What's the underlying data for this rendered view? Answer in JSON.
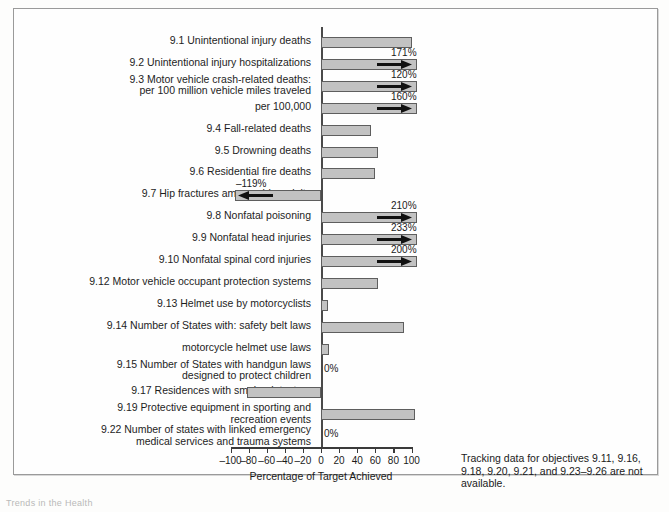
{
  "figure": {
    "x_axis_title": "Percentage of Target Achieved",
    "note": "Tracking data for objectives 9.11, 9.16, 9.18, 9.20, 9.21, and 9.23–9.26 are not available.",
    "bottom_caption": "Trends in the Health",
    "bar_fill_color": "#c2c2c2",
    "bar_border_color": "#5e5e5e"
  },
  "chart_data": {
    "type": "bar",
    "orientation": "horizontal",
    "title": "",
    "xlabel": "Percentage of Target Achieved",
    "ylabel": "",
    "xlim": [
      -100,
      100
    ],
    "xticks": [
      -100,
      -80,
      -60,
      -40,
      -20,
      0,
      20,
      40,
      60,
      80,
      100
    ],
    "xticklabels": [
      "–100",
      "–80",
      "–60",
      "–40",
      "–20",
      "0",
      "20",
      "40",
      "60",
      "80",
      "100"
    ],
    "grid": false,
    "legend": false,
    "categories": [
      "9.1 Unintentional injury deaths",
      "9.2 Unintentional injury hospitalizations",
      "9.3 Motor vehicle crash-related deaths:\nper 100 million vehicle miles traveled",
      "per 100,000",
      "9.4 Fall-related deaths",
      "9.5 Drowning deaths",
      "9.6 Residential fire deaths",
      "9.7 Hip fractures among older adults",
      "9.8 Nonfatal poisoning",
      "9.9 Nonfatal head injuries",
      "9.10 Nonfatal spinal cord injuries",
      "9.12 Motor vehicle occupant protection systems",
      "9.13 Helmet use by motorcyclists",
      "9.14 Number of States with: safety belt laws",
      "motorcycle helmet use laws",
      "9.15 Number of States with handgun laws\ndesigned to protect children",
      "9.17 Residences with smoke detectors",
      "9.19 Protective equipment in sporting and\nrecreation events",
      "9.22 Number of states with linked emergency\nmedical services and trauma systems"
    ],
    "values": [
      100,
      171,
      120,
      160,
      55,
      63,
      60,
      -119,
      210,
      233,
      200,
      63,
      8,
      92,
      9,
      0,
      -82,
      104,
      0
    ],
    "value_labels": [
      "",
      "171%",
      "120%",
      "160%",
      "",
      "",
      "",
      "–119%",
      "210%",
      "233%",
      "200%",
      "",
      "",
      "",
      "",
      "0%",
      "",
      "",
      "0%"
    ],
    "clipped": [
      false,
      true,
      true,
      true,
      false,
      false,
      false,
      true,
      true,
      true,
      true,
      false,
      false,
      false,
      false,
      false,
      false,
      false,
      false
    ]
  }
}
